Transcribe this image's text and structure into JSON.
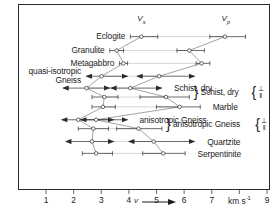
{
  "figure": {
    "axis_unit": "km s",
    "axis_unit_sup": "-1",
    "axis_var": "v",
    "header_left": "V",
    "header_left_sub": "s",
    "header_right": "V",
    "header_right_sub": "p",
    "perp_symbol": "⊥",
    "par_symbol": "‖",
    "brace_left": "}",
    "brace_right": "{"
  },
  "chart_data": {
    "type": "bar",
    "xlabel": "v (km s-1)",
    "ylabel": "",
    "xlim": [
      0,
      9
    ],
    "grid": false,
    "legend": "none",
    "xticks": [
      1,
      2,
      3,
      4,
      5,
      6,
      7,
      8,
      9
    ],
    "xticklabels": [
      "1",
      "2",
      "3",
      "4",
      "5",
      "6",
      "7",
      "km s-1",
      "9"
    ],
    "series": [
      {
        "name": "Vs",
        "description": "shear wave velocity ranges with mean markers"
      },
      {
        "name": "Vp",
        "description": "compressional wave velocity ranges with mean markers"
      }
    ],
    "rows": [
      {
        "label": "Eclogite",
        "label_lines": [
          "Eclogite"
        ],
        "side": "left",
        "anisotropy": null,
        "vs": {
          "min": 4.05,
          "mean": 4.45,
          "max": 5.05,
          "arrows": false
        },
        "vp": {
          "min": 6.95,
          "mean": 7.5,
          "max": 8.25,
          "arrows": false
        }
      },
      {
        "label": "Granulite",
        "label_lines": [
          "Granulite"
        ],
        "side": "left",
        "anisotropy": null,
        "vs": {
          "min": 3.3,
          "mean": 3.55,
          "max": 3.8,
          "arrows": false
        },
        "vp": {
          "min": 5.75,
          "mean": 6.2,
          "max": 6.75,
          "arrows": false
        }
      },
      {
        "label": "Metagabbro",
        "label_lines": [
          "Metagabbro"
        ],
        "side": "left",
        "anisotropy": null,
        "vs": {
          "min": 3.65,
          "mean": 3.8,
          "max": 3.95,
          "arrows": false
        },
        "vp": {
          "min": 6.45,
          "mean": 6.65,
          "max": 6.95,
          "arrows": false
        }
      },
      {
        "label": "quasi-isotropic Gneiss",
        "label_lines": [
          "quasi-isotropic",
          "Gneiss"
        ],
        "side": "left",
        "anisotropy": null,
        "vs": {
          "min": 2.45,
          "mean": 3.0,
          "max": 3.95,
          "arrows": true
        },
        "vp": {
          "min": 4.3,
          "mean": 5.1,
          "max": 6.4,
          "arrows": true
        }
      },
      {
        "label": "Schist, dry",
        "label_lines": [
          "Schist, dry"
        ],
        "side": "right",
        "anisotropy": "perp",
        "vs": {
          "min": 1.6,
          "mean": 2.45,
          "max": 3.3,
          "arrows": true
        },
        "vp": {
          "min": 3.35,
          "mean": 4.05,
          "max": 5.2,
          "arrows": true
        }
      },
      {
        "label": "Schist, dry",
        "label_lines": [
          ""
        ],
        "side": "right",
        "anisotropy": "par",
        "vs": {
          "min": 2.65,
          "mean": 3.1,
          "max": 3.6,
          "arrows": false
        },
        "vp": {
          "min": 4.4,
          "mean": 5.35,
          "max": 6.2,
          "arrows": false
        }
      },
      {
        "label": "Marble",
        "label_lines": [
          "Marble"
        ],
        "side": "right",
        "anisotropy": null,
        "vs": {
          "min": 2.65,
          "mean": 3.05,
          "max": 3.5,
          "arrows": false
        },
        "vp": {
          "min": 5.0,
          "mean": 5.85,
          "max": 6.6,
          "arrows": false
        }
      },
      {
        "label": "anisotropic Gneiss",
        "label_lines": [
          "anisotropic Gneiss"
        ],
        "side": "right",
        "anisotropy": "perp",
        "vs": {
          "min": 1.55,
          "mean": 2.15,
          "max": 3.45,
          "arrows": true
        },
        "vp": {
          "min": 2.25,
          "mean": 2.8,
          "max": 3.95,
          "arrows": true
        }
      },
      {
        "label": "anisotropic Gneiss",
        "label_lines": [
          ""
        ],
        "side": "right",
        "anisotropy": "par",
        "vs": {
          "min": 2.15,
          "mean": 2.7,
          "max": 3.25,
          "arrows": false
        },
        "vp": {
          "min": 3.55,
          "mean": 4.35,
          "max": 5.2,
          "arrows": false
        }
      },
      {
        "label": "Quartzite",
        "label_lines": [
          "Quartzite"
        ],
        "side": "right",
        "anisotropy": null,
        "vs": {
          "min": 1.7,
          "mean": 2.65,
          "max": 3.45,
          "arrows": true
        },
        "vp": {
          "min": 4.0,
          "mean": 4.9,
          "max": 6.4,
          "arrows": true
        }
      },
      {
        "label": "Serpentinite",
        "label_lines": [
          "Serpentinite"
        ],
        "side": "right",
        "anisotropy": null,
        "vs": {
          "min": 2.3,
          "mean": 2.8,
          "max": 3.4,
          "arrows": false
        },
        "vp": {
          "min": 4.5,
          "mean": 5.25,
          "max": 6.05,
          "arrows": false
        }
      }
    ],
    "connectors": [
      {
        "from_row": 0,
        "to_row": 1,
        "note": "Vs mean linked down-left"
      },
      {
        "from_row": 1,
        "to_row": 2,
        "note": "Vs mean linked"
      },
      {
        "from_row": 2,
        "to_row": 3,
        "note": "Vs mean linked"
      },
      {
        "from_row": 3,
        "to_row": 4,
        "note": "Vs mean linked"
      },
      {
        "from_row": 4,
        "to_row": 5,
        "note": "Vs mean linked"
      },
      {
        "from_row": 5,
        "to_row": 6,
        "note": "Vs mean linked"
      },
      {
        "from_row": 6,
        "to_row": 7,
        "note": "Vs mean linked"
      },
      {
        "from_row": 7,
        "to_row": 8,
        "note": "Vs mean linked"
      },
      {
        "from_row": 8,
        "to_row": 9,
        "note": "Vs mean linked"
      },
      {
        "from_row": 9,
        "to_row": 10,
        "note": "Vs mean linked"
      }
    ]
  },
  "caption": ""
}
